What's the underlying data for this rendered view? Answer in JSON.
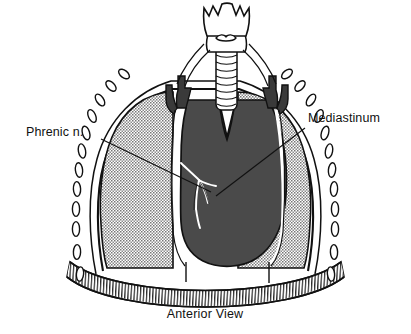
{
  "figure": {
    "caption": "Anterior View",
    "background_color": "#ffffff",
    "ink_color": "#111111"
  },
  "labels": [
    {
      "id": "phrenic-nerve",
      "text": "Phrenic n.",
      "text_x": 26,
      "text_y": 136,
      "anchor": "start",
      "leader": {
        "x1": 101,
        "y1": 139,
        "x2": 211,
        "y2": 192
      }
    },
    {
      "id": "mediastinum",
      "text": "Mediastinum",
      "text_x": 308,
      "text_y": 122,
      "anchor": "start",
      "leader": {
        "x1": 305,
        "y1": 128,
        "x2": 216,
        "y2": 196
      }
    }
  ],
  "caption": {
    "text": "Anterior View",
    "x": 205,
    "y": 318
  },
  "structures": [
    {
      "id": "larynx",
      "name": "Larynx / thyroid cartilage",
      "fill": "#ffffff",
      "stroke": "#111111"
    },
    {
      "id": "trachea",
      "name": "Trachea",
      "fill": "#ffffff",
      "stroke": "#111111",
      "ring_count": 9
    },
    {
      "id": "left-lung",
      "name": "Left lung",
      "fill": "stipple",
      "stroke": "#111111"
    },
    {
      "id": "right-lung",
      "name": "Right lung",
      "fill": "stipple",
      "stroke": "#111111"
    },
    {
      "id": "mediastinum-mass",
      "name": "Mediastinum",
      "fill": "#4a4a4a",
      "stroke": "#111111"
    },
    {
      "id": "great-vessels",
      "name": "Great vessels",
      "fill": "#3a3a3a",
      "stroke": "#111111"
    },
    {
      "id": "phrenic-nerve-branches",
      "name": "Phrenic nerve branches",
      "stroke": "#ffffff"
    },
    {
      "id": "diaphragm",
      "name": "Diaphragm",
      "fill": "#ffffff",
      "stroke": "#111111",
      "hatch": true
    },
    {
      "id": "chest-wall",
      "name": "Chest wall / pleura",
      "fill": "#ffffff",
      "stroke": "#111111"
    },
    {
      "id": "ribs-left",
      "name": "Cut rib ends (left)",
      "count": 10,
      "fill": "#ffffff",
      "stroke": "#111111"
    },
    {
      "id": "ribs-right",
      "name": "Cut rib ends (right)",
      "count": 10,
      "fill": "#ffffff",
      "stroke": "#111111"
    }
  ],
  "colors": {
    "mediastinum": "#4a4a4a",
    "vessels": "#3a3a3a",
    "lung_stipple": "#6f6f6f",
    "outline": "#111111",
    "paper": "#ffffff"
  },
  "ribs": {
    "left": [
      {
        "cx": 124,
        "cy": 74,
        "rx": 3.6,
        "ry": 6.2,
        "rot": -52
      },
      {
        "cx": 111,
        "cy": 86,
        "rx": 3.6,
        "ry": 6.4,
        "rot": -44
      },
      {
        "cx": 100,
        "cy": 100,
        "rx": 3.6,
        "ry": 6.6,
        "rot": -34
      },
      {
        "cx": 92,
        "cy": 116,
        "rx": 3.6,
        "ry": 6.8,
        "rot": -24
      },
      {
        "cx": 86,
        "cy": 133,
        "rx": 3.6,
        "ry": 7.0,
        "rot": -16
      },
      {
        "cx": 82,
        "cy": 151,
        "rx": 3.6,
        "ry": 7.2,
        "rot": -10
      },
      {
        "cx": 79,
        "cy": 170,
        "rx": 3.6,
        "ry": 7.3,
        "rot": -6
      },
      {
        "cx": 77,
        "cy": 189,
        "rx": 3.6,
        "ry": 7.4,
        "rot": -3
      },
      {
        "cx": 76,
        "cy": 209,
        "rx": 3.6,
        "ry": 7.4,
        "rot": 0
      },
      {
        "cx": 76,
        "cy": 229,
        "rx": 3.6,
        "ry": 7.4,
        "rot": 0
      },
      {
        "cx": 77,
        "cy": 252,
        "rx": 3.6,
        "ry": 7.4,
        "rot": 2
      },
      {
        "cx": 80,
        "cy": 274,
        "rx": 3.6,
        "ry": 7.2,
        "rot": 6
      }
    ],
    "right": [
      {
        "cx": 287,
        "cy": 74,
        "rx": 3.6,
        "ry": 6.2,
        "rot": 52
      },
      {
        "cx": 300,
        "cy": 86,
        "rx": 3.6,
        "ry": 6.4,
        "rot": 44
      },
      {
        "cx": 311,
        "cy": 100,
        "rx": 3.6,
        "ry": 6.6,
        "rot": 34
      },
      {
        "cx": 319,
        "cy": 116,
        "rx": 3.6,
        "ry": 6.8,
        "rot": 24
      },
      {
        "cx": 325,
        "cy": 133,
        "rx": 3.6,
        "ry": 7.0,
        "rot": 16
      },
      {
        "cx": 329,
        "cy": 151,
        "rx": 3.6,
        "ry": 7.2,
        "rot": 10
      },
      {
        "cx": 332,
        "cy": 170,
        "rx": 3.6,
        "ry": 7.3,
        "rot": 6
      },
      {
        "cx": 334,
        "cy": 189,
        "rx": 3.6,
        "ry": 7.4,
        "rot": 3
      },
      {
        "cx": 335,
        "cy": 209,
        "rx": 3.6,
        "ry": 7.4,
        "rot": 0
      },
      {
        "cx": 335,
        "cy": 229,
        "rx": 3.6,
        "ry": 7.4,
        "rot": 0
      },
      {
        "cx": 334,
        "cy": 252,
        "rx": 3.6,
        "ry": 7.4,
        "rot": -2
      },
      {
        "cx": 331,
        "cy": 274,
        "rx": 3.6,
        "ry": 7.2,
        "rot": -6
      }
    ]
  }
}
